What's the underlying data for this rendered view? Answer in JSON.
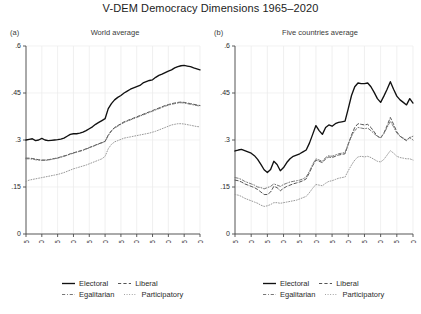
{
  "title": "V-DEM Democracy Dimensions 1965–2020",
  "panels": [
    {
      "tag": "(a)",
      "subtitle": "World average"
    },
    {
      "tag": "(b)",
      "subtitle": "Five countries average"
    }
  ],
  "legend": {
    "entries": [
      {
        "label": "Electoral",
        "style": "solid",
        "color": "#111111"
      },
      {
        "label": "Liberal",
        "style": "dashed",
        "color": "#555555"
      },
      {
        "label": "Egalitarian",
        "style": "dashdot",
        "color": "#777777"
      },
      {
        "label": "Participatory",
        "style": "dotted",
        "color": "#999999"
      }
    ]
  },
  "axis": {
    "yticks": [
      "0",
      ".15",
      ".3",
      ".45",
      ".6"
    ],
    "xticks": [
      "1965",
      "1970",
      "1975",
      "1980",
      "1985",
      "1990",
      "1995",
      "2000",
      "2005",
      "2010",
      "2015",
      "2020"
    ]
  },
  "chart_data": {
    "type": "line",
    "title": "V-DEM Democracy Dimensions 1965–2020",
    "xlabel": "",
    "ylabel": "",
    "xlim": [
      1965,
      2020
    ],
    "ylim": [
      0,
      0.6
    ],
    "ytick_values": [
      0,
      0.15,
      0.3,
      0.45,
      0.6
    ],
    "xtick_values": [
      1965,
      1970,
      1975,
      1980,
      1985,
      1990,
      1995,
      2000,
      2005,
      2010,
      2015,
      2020
    ],
    "grid": true,
    "legend_position": "bottom",
    "panels": [
      {
        "tag": "(a)",
        "subtitle": "World average",
        "x": [
          1965,
          1966,
          1967,
          1968,
          1969,
          1970,
          1971,
          1972,
          1973,
          1974,
          1975,
          1976,
          1977,
          1978,
          1979,
          1980,
          1981,
          1982,
          1983,
          1984,
          1985,
          1986,
          1987,
          1988,
          1989,
          1990,
          1991,
          1992,
          1993,
          1994,
          1995,
          1996,
          1997,
          1998,
          1999,
          2000,
          2001,
          2002,
          2003,
          2004,
          2005,
          2006,
          2007,
          2008,
          2009,
          2010,
          2011,
          2012,
          2013,
          2014,
          2015,
          2016,
          2017,
          2018,
          2019,
          2020
        ],
        "series": [
          {
            "name": "Electoral",
            "style": "solid",
            "values": [
              0.3,
              0.302,
              0.304,
              0.298,
              0.3,
              0.305,
              0.3,
              0.298,
              0.299,
              0.3,
              0.301,
              0.303,
              0.306,
              0.312,
              0.318,
              0.32,
              0.32,
              0.322,
              0.325,
              0.33,
              0.336,
              0.342,
              0.35,
              0.356,
              0.362,
              0.368,
              0.4,
              0.416,
              0.428,
              0.436,
              0.442,
              0.45,
              0.456,
              0.462,
              0.466,
              0.47,
              0.474,
              0.482,
              0.486,
              0.49,
              0.492,
              0.5,
              0.506,
              0.51,
              0.515,
              0.52,
              0.524,
              0.53,
              0.534,
              0.537,
              0.538,
              0.536,
              0.534,
              0.53,
              0.527,
              0.524
            ]
          },
          {
            "name": "Liberal",
            "style": "dashed",
            "values": [
              0.242,
              0.242,
              0.241,
              0.239,
              0.237,
              0.236,
              0.236,
              0.237,
              0.239,
              0.241,
              0.243,
              0.246,
              0.249,
              0.252,
              0.256,
              0.259,
              0.262,
              0.265,
              0.268,
              0.272,
              0.276,
              0.28,
              0.284,
              0.288,
              0.292,
              0.296,
              0.316,
              0.33,
              0.34,
              0.346,
              0.352,
              0.358,
              0.362,
              0.366,
              0.37,
              0.374,
              0.378,
              0.382,
              0.386,
              0.39,
              0.394,
              0.398,
              0.402,
              0.406,
              0.41,
              0.413,
              0.416,
              0.418,
              0.42,
              0.421,
              0.42,
              0.418,
              0.416,
              0.414,
              0.412,
              0.41
            ]
          },
          {
            "name": "Egalitarian",
            "style": "dashdot",
            "values": [
              0.24,
              0.24,
              0.239,
              0.237,
              0.236,
              0.235,
              0.235,
              0.236,
              0.238,
              0.24,
              0.242,
              0.245,
              0.248,
              0.251,
              0.255,
              0.258,
              0.261,
              0.264,
              0.267,
              0.271,
              0.275,
              0.279,
              0.283,
              0.287,
              0.291,
              0.295,
              0.314,
              0.328,
              0.338,
              0.344,
              0.35,
              0.356,
              0.36,
              0.364,
              0.368,
              0.372,
              0.376,
              0.38,
              0.384,
              0.388,
              0.392,
              0.396,
              0.4,
              0.404,
              0.408,
              0.411,
              0.414,
              0.416,
              0.418,
              0.419,
              0.418,
              0.416,
              0.414,
              0.412,
              0.41,
              0.408
            ]
          },
          {
            "name": "Participatory",
            "style": "dotted",
            "values": [
              0.168,
              0.172,
              0.174,
              0.176,
              0.178,
              0.18,
              0.182,
              0.184,
              0.186,
              0.188,
              0.19,
              0.193,
              0.196,
              0.2,
              0.204,
              0.208,
              0.211,
              0.214,
              0.217,
              0.22,
              0.224,
              0.228,
              0.232,
              0.236,
              0.24,
              0.248,
              0.272,
              0.286,
              0.294,
              0.298,
              0.302,
              0.306,
              0.308,
              0.31,
              0.312,
              0.314,
              0.316,
              0.318,
              0.32,
              0.322,
              0.325,
              0.328,
              0.332,
              0.336,
              0.34,
              0.344,
              0.348,
              0.35,
              0.352,
              0.352,
              0.351,
              0.349,
              0.347,
              0.345,
              0.343,
              0.342
            ]
          }
        ]
      },
      {
        "tag": "(b)",
        "subtitle": "Five countries average",
        "x": [
          1965,
          1966,
          1967,
          1968,
          1969,
          1970,
          1971,
          1972,
          1973,
          1974,
          1975,
          1976,
          1977,
          1978,
          1979,
          1980,
          1981,
          1982,
          1983,
          1984,
          1985,
          1986,
          1987,
          1988,
          1989,
          1990,
          1991,
          1992,
          1993,
          1994,
          1995,
          1996,
          1997,
          1998,
          1999,
          2000,
          2001,
          2002,
          2003,
          2004,
          2005,
          2006,
          2007,
          2008,
          2009,
          2010,
          2011,
          2012,
          2013,
          2014,
          2015,
          2016,
          2017,
          2018,
          2019,
          2020
        ],
        "series": [
          {
            "name": "Electoral",
            "style": "solid",
            "values": [
              0.265,
              0.268,
              0.27,
              0.266,
              0.262,
              0.258,
              0.25,
              0.238,
              0.222,
              0.205,
              0.196,
              0.206,
              0.232,
              0.222,
              0.202,
              0.212,
              0.228,
              0.24,
              0.248,
              0.252,
              0.256,
              0.262,
              0.268,
              0.29,
              0.318,
              0.346,
              0.33,
              0.318,
              0.34,
              0.348,
              0.344,
              0.352,
              0.356,
              0.358,
              0.36,
              0.4,
              0.442,
              0.47,
              0.482,
              0.48,
              0.48,
              0.482,
              0.47,
              0.452,
              0.432,
              0.42,
              0.44,
              0.462,
              0.486,
              0.462,
              0.44,
              0.428,
              0.42,
              0.412,
              0.432,
              0.418
            ]
          },
          {
            "name": "Liberal",
            "style": "dashed",
            "values": [
              0.172,
              0.17,
              0.166,
              0.16,
              0.156,
              0.152,
              0.148,
              0.142,
              0.134,
              0.126,
              0.126,
              0.134,
              0.152,
              0.148,
              0.138,
              0.146,
              0.152,
              0.156,
              0.16,
              0.163,
              0.166,
              0.17,
              0.176,
              0.196,
              0.218,
              0.236,
              0.232,
              0.228,
              0.24,
              0.246,
              0.244,
              0.248,
              0.252,
              0.254,
              0.256,
              0.286,
              0.316,
              0.34,
              0.352,
              0.35,
              0.348,
              0.35,
              0.34,
              0.326,
              0.312,
              0.306,
              0.322,
              0.346,
              0.372,
              0.35,
              0.326,
              0.312,
              0.304,
              0.298,
              0.308,
              0.3
            ]
          },
          {
            "name": "Egalitarian",
            "style": "dashdot",
            "values": [
              0.18,
              0.178,
              0.174,
              0.168,
              0.164,
              0.16,
              0.156,
              0.15,
              0.148,
              0.144,
              0.148,
              0.152,
              0.16,
              0.156,
              0.152,
              0.158,
              0.162,
              0.166,
              0.168,
              0.17,
              0.172,
              0.176,
              0.182,
              0.2,
              0.222,
              0.24,
              0.236,
              0.232,
              0.244,
              0.25,
              0.248,
              0.252,
              0.256,
              0.258,
              0.26,
              0.288,
              0.312,
              0.33,
              0.34,
              0.338,
              0.336,
              0.338,
              0.33,
              0.32,
              0.312,
              0.308,
              0.32,
              0.34,
              0.36,
              0.342,
              0.322,
              0.312,
              0.306,
              0.3,
              0.308,
              0.312
            ]
          },
          {
            "name": "Participatory",
            "style": "dotted",
            "values": [
              0.126,
              0.124,
              0.12,
              0.114,
              0.11,
              0.106,
              0.102,
              0.098,
              0.092,
              0.088,
              0.09,
              0.094,
              0.1,
              0.1,
              0.098,
              0.1,
              0.102,
              0.104,
              0.106,
              0.108,
              0.112,
              0.116,
              0.12,
              0.132,
              0.146,
              0.158,
              0.156,
              0.154,
              0.162,
              0.168,
              0.17,
              0.174,
              0.178,
              0.18,
              0.182,
              0.202,
              0.22,
              0.236,
              0.246,
              0.248,
              0.246,
              0.248,
              0.244,
              0.238,
              0.232,
              0.23,
              0.238,
              0.252,
              0.266,
              0.258,
              0.248,
              0.244,
              0.242,
              0.24,
              0.24,
              0.236
            ]
          }
        ]
      }
    ]
  }
}
